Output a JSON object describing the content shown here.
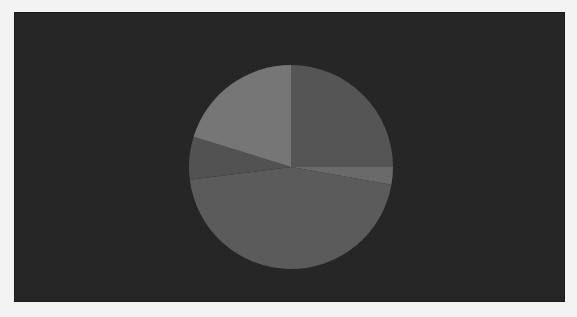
{
  "chart_data": {
    "type": "pie",
    "title": "",
    "start_angle_deg": 0,
    "direction": "clockwise",
    "center": [
      291,
      167
    ],
    "radius": 102,
    "background": "#262626",
    "legend": null,
    "slices": [
      {
        "label": "",
        "value": 25.0,
        "color": "#555555"
      },
      {
        "label": "",
        "value": 2.8,
        "color": "#6a6a6a"
      },
      {
        "label": "",
        "value": 45.2,
        "color": "#5b5b5b"
      },
      {
        "label": "",
        "value": 6.8,
        "color": "#525252"
      },
      {
        "label": "",
        "value": 20.2,
        "color": "#767676"
      }
    ]
  },
  "caption": {
    "text": ""
  }
}
